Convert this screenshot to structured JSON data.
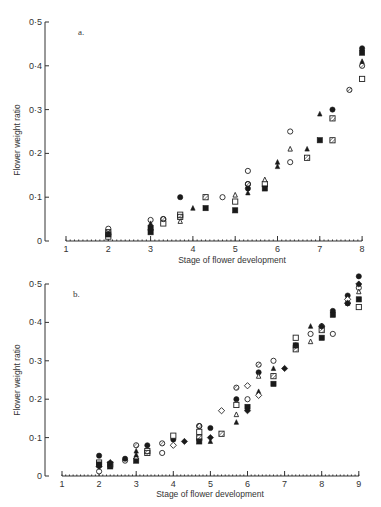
{
  "chart_data": [
    {
      "type": "scatter",
      "panel": "a.",
      "title": "",
      "xlabel": "Stage of flower development",
      "ylabel": "Flower weight ratio",
      "x_ticks": [
        "1",
        "2",
        "3",
        "4",
        "5",
        "6",
        "7",
        "8"
      ],
      "y_ticks": [
        "0",
        "0·1",
        "0·2",
        "0·3",
        "0·4",
        "0·5"
      ],
      "xlim": [
        1,
        8
      ],
      "ylim": [
        0,
        0.5
      ],
      "grid": false,
      "legend": "none",
      "series": [
        {
          "name": "open-circle",
          "points": [
            [
              2,
              0.028
            ],
            [
              3,
              0.048
            ],
            [
              3.3,
              0.05
            ],
            [
              4.7,
              0.1
            ],
            [
              5.3,
              0.16
            ],
            [
              5.3,
              0.13
            ],
            [
              6.3,
              0.25
            ],
            [
              6.3,
              0.18
            ]
          ]
        },
        {
          "name": "filled-circle",
          "points": [
            [
              3.7,
              0.1
            ],
            [
              5.3,
              0.12
            ],
            [
              7.3,
              0.3
            ],
            [
              8,
              0.44
            ]
          ]
        },
        {
          "name": "open-square",
          "points": [
            [
              2,
              0.01
            ],
            [
              3.3,
              0.04
            ],
            [
              3.7,
              0.06
            ],
            [
              5,
              0.09
            ],
            [
              5.7,
              0.13
            ],
            [
              8,
              0.37
            ]
          ]
        },
        {
          "name": "filled-square",
          "points": [
            [
              2,
              0.015
            ],
            [
              3,
              0.03
            ],
            [
              3,
              0.02
            ],
            [
              4.3,
              0.075
            ],
            [
              5,
              0.07
            ],
            [
              5.7,
              0.12
            ],
            [
              7,
              0.23
            ],
            [
              8,
              0.43
            ]
          ]
        },
        {
          "name": "hatched-square",
          "points": [
            [
              2,
              0.02
            ],
            [
              3.7,
              0.055
            ],
            [
              4.3,
              0.1
            ],
            [
              6.7,
              0.19
            ],
            [
              7.3,
              0.28
            ],
            [
              7.3,
              0.23
            ]
          ]
        },
        {
          "name": "open-triangle",
          "points": [
            [
              3.7,
              0.045
            ],
            [
              5,
              0.105
            ],
            [
              5.7,
              0.14
            ],
            [
              6.3,
              0.21
            ]
          ]
        },
        {
          "name": "filled-triangle",
          "points": [
            [
              3,
              0.04
            ],
            [
              4,
              0.075
            ],
            [
              5.3,
              0.11
            ],
            [
              6,
              0.18
            ],
            [
              6,
              0.17
            ],
            [
              6.7,
              0.21
            ],
            [
              7,
              0.29
            ],
            [
              8,
              0.41
            ]
          ]
        },
        {
          "name": "hatched-circle",
          "points": [
            [
              3.3,
              0.05
            ],
            [
              5.3,
              0.13
            ],
            [
              7.7,
              0.345
            ],
            [
              8,
              0.4
            ]
          ]
        }
      ]
    },
    {
      "type": "scatter",
      "panel": "b.",
      "title": "",
      "xlabel": "Stage of flower development",
      "ylabel": "Flower weight ratio",
      "x_ticks": [
        "1",
        "2",
        "3",
        "4",
        "5",
        "6",
        "7",
        "8",
        "9"
      ],
      "y_ticks": [
        "0",
        "0·1",
        "0·2",
        "0·3",
        "0·4",
        "0·5"
      ],
      "xlim": [
        1,
        9
      ],
      "ylim": [
        0,
        0.5
      ],
      "grid": false,
      "legend": "none",
      "series": [
        {
          "name": "open-circle",
          "points": [
            [
              2,
              0.012
            ],
            [
              2.7,
              0.04
            ],
            [
              3.7,
              0.06
            ],
            [
              4.7,
              0.13
            ],
            [
              6,
              0.2
            ],
            [
              6.7,
              0.3
            ],
            [
              7.7,
              0.37
            ],
            [
              8.3,
              0.37
            ],
            [
              8.7,
              0.45
            ],
            [
              9,
              0.49
            ]
          ]
        },
        {
          "name": "filled-circle",
          "points": [
            [
              2,
              0.053
            ],
            [
              2.7,
              0.045
            ],
            [
              3.3,
              0.08
            ],
            [
              4,
              0.095
            ],
            [
              5,
              0.125
            ],
            [
              5.7,
              0.2
            ],
            [
              6.3,
              0.27
            ],
            [
              7.3,
              0.34
            ],
            [
              8.3,
              0.43
            ],
            [
              8.7,
              0.47
            ],
            [
              9,
              0.52
            ]
          ]
        },
        {
          "name": "open-square",
          "points": [
            [
              2,
              0.035
            ],
            [
              3.3,
              0.065
            ],
            [
              4,
              0.105
            ],
            [
              4.7,
              0.115
            ],
            [
              5.7,
              0.185
            ],
            [
              7.3,
              0.36
            ],
            [
              9,
              0.44
            ]
          ]
        },
        {
          "name": "filled-square",
          "points": [
            [
              2,
              0.03
            ],
            [
              2.3,
              0.025
            ],
            [
              3,
              0.04
            ],
            [
              4.7,
              0.09
            ],
            [
              6,
              0.18
            ],
            [
              6.7,
              0.24
            ],
            [
              7.3,
              0.34
            ],
            [
              8,
              0.36
            ],
            [
              8.3,
              0.42
            ],
            [
              9,
              0.46
            ]
          ]
        },
        {
          "name": "hatched-square",
          "points": [
            [
              2.3,
              0.03
            ],
            [
              3.3,
              0.06
            ],
            [
              4.7,
              0.1
            ],
            [
              5.3,
              0.11
            ],
            [
              6.7,
              0.26
            ],
            [
              8,
              0.38
            ],
            [
              7.3,
              0.33
            ]
          ]
        },
        {
          "name": "open-triangle",
          "points": [
            [
              3,
              0.05
            ],
            [
              5.7,
              0.16
            ],
            [
              6.3,
              0.26
            ],
            [
              7.7,
              0.35
            ],
            [
              9,
              0.48
            ]
          ]
        },
        {
          "name": "filled-triangle",
          "points": [
            [
              3,
              0.065
            ],
            [
              3,
              0.055
            ],
            [
              5,
              0.09
            ],
            [
              5.7,
              0.14
            ],
            [
              6.3,
              0.22
            ],
            [
              6.7,
              0.28
            ],
            [
              7.7,
              0.39
            ],
            [
              8.7,
              0.45
            ],
            [
              9,
              0.5
            ]
          ]
        },
        {
          "name": "open-diamond",
          "points": [
            [
              4,
              0.08
            ],
            [
              5.3,
              0.17
            ],
            [
              6,
              0.235
            ],
            [
              6.3,
              0.21
            ],
            [
              8.7,
              0.46
            ]
          ]
        },
        {
          "name": "filled-diamond",
          "points": [
            [
              2,
              0.025
            ],
            [
              2.3,
              0.035
            ],
            [
              4.3,
              0.09
            ],
            [
              5,
              0.1
            ],
            [
              6,
              0.17
            ],
            [
              7,
              0.28
            ],
            [
              8,
              0.39
            ],
            [
              8.7,
              0.45
            ],
            [
              9,
              0.5
            ]
          ]
        },
        {
          "name": "hatched-circle",
          "points": [
            [
              3,
              0.08
            ],
            [
              3.7,
              0.085
            ],
            [
              4.7,
              0.13
            ],
            [
              5.7,
              0.23
            ],
            [
              6.3,
              0.29
            ],
            [
              8,
              0.39
            ]
          ]
        }
      ]
    }
  ]
}
